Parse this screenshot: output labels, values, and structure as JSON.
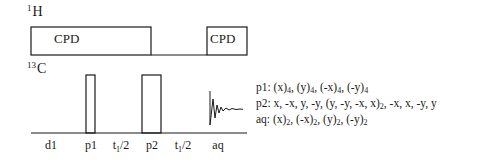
{
  "channels": {
    "proton": {
      "mass": "1",
      "symbol": "H"
    },
    "carbon": {
      "mass": "13",
      "symbol": "C"
    }
  },
  "proton_blocks": [
    {
      "label": "CPD",
      "x_start": 31,
      "x_end": 151
    },
    {
      "label": "CPD",
      "x_start": 207,
      "x_end": 247
    }
  ],
  "carbon_pulses": [
    {
      "name": "p1",
      "x_start": 86,
      "x_end": 95
    },
    {
      "name": "p2",
      "x_start": 142,
      "x_end": 161
    }
  ],
  "timeline_labels": [
    {
      "id": "d1",
      "text": "d1",
      "x": 51
    },
    {
      "id": "p1",
      "text": "p1",
      "x": 91
    },
    {
      "id": "t1a",
      "text": "t",
      "sub": "1",
      "tail": "/2",
      "x": 121
    },
    {
      "id": "p2",
      "text": "p2",
      "x": 152
    },
    {
      "id": "t1b",
      "text": "t",
      "sub": "1",
      "tail": "/2",
      "x": 183
    },
    {
      "id": "aq",
      "text": "aq",
      "x": 218
    }
  ],
  "phase_cycles": {
    "p1": {
      "label": "p1:",
      "parts": [
        [
          "(x)",
          "4"
        ],
        [
          "(y)",
          "4"
        ],
        [
          "(-x)",
          "4"
        ],
        [
          "(-y)",
          "4"
        ]
      ]
    },
    "p2": {
      "label": "p2:",
      "text_a": "x, -x, y, -y, (y, -y, -x, x)",
      "sub": "2",
      "text_b": ", -x, x, -y, y"
    },
    "aq": {
      "label": "aq:",
      "parts": [
        [
          "(x)",
          "2"
        ],
        [
          "(-x)",
          "2"
        ],
        [
          "(y)",
          "2"
        ],
        [
          "(-y)",
          "2"
        ]
      ]
    }
  }
}
